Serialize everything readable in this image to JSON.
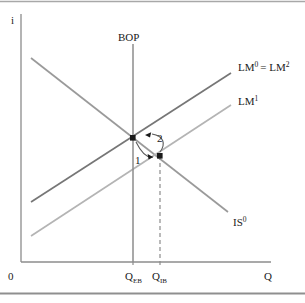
{
  "figure": {
    "type": "is-lm-bp-diagram",
    "axes": {
      "y_label": "i",
      "x_label": "Q",
      "origin_label": "0"
    },
    "curves": [
      {
        "id": "bop",
        "label": "BOP",
        "sup": "",
        "color": "#808080",
        "orientation": "vertical"
      },
      {
        "id": "lm0",
        "label": "LM",
        "sup": "0",
        "eq_label": "= LM",
        "eq_sup": "2",
        "color": "#767676",
        "orientation": "upward"
      },
      {
        "id": "lm1",
        "label": "LM",
        "sup": "1",
        "color": "#b0b0b0",
        "orientation": "upward"
      },
      {
        "id": "is0",
        "label": "IS",
        "sup": "0",
        "color": "#9a9a9a",
        "orientation": "downward"
      }
    ],
    "curve_label_text": {
      "lm0_full": "LM",
      "lm0_sup": "0",
      "lm0_eq": "= LM",
      "lm0_eq_sup": "2",
      "lm1_base": "LM",
      "lm1_sup": "1",
      "is0_base": "IS",
      "is0_sup": "0",
      "bop": "BOP"
    },
    "ticks": [
      {
        "id": "q-eb",
        "base": "Q",
        "sub": "EB"
      },
      {
        "id": "q-ib",
        "base": "Q",
        "sub": "IB"
      }
    ],
    "points": [
      {
        "id": "point-a",
        "note": "initial equilibrium on BOP and LM0"
      },
      {
        "id": "point-b",
        "note": "shifted equilibrium on LM1 at Q_IB"
      }
    ],
    "step_labels": [
      {
        "id": "step-1",
        "text": "1"
      },
      {
        "id": "step-2",
        "text": "2"
      }
    ],
    "colors": {
      "axis": "#8c8c8c",
      "bop": "#8c8c8c",
      "lm0": "#767676",
      "lm1": "#b4b4b4",
      "is0": "#9a9a9a",
      "point": "#1a1a1a",
      "dashed": "#8c8c8c",
      "border": "#9a9a9a",
      "text": "#1a1a1a"
    }
  }
}
